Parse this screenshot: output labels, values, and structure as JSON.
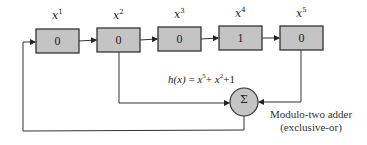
{
  "diagram": {
    "registers": [
      {
        "label_base": "x",
        "label_exp": "1",
        "value": "0"
      },
      {
        "label_base": "x",
        "label_exp": "2",
        "value": "0"
      },
      {
        "label_base": "x",
        "label_exp": "3",
        "value": "0"
      },
      {
        "label_base": "x",
        "label_exp": "4",
        "value": "1"
      },
      {
        "label_base": "x",
        "label_exp": "5",
        "value": "0"
      }
    ],
    "formula": {
      "lhs": "h(x)",
      "eq": " = ",
      "t1_base": "x",
      "t1_exp": "5",
      "plus1": "+ ",
      "t2_base": "x",
      "t2_exp": "2",
      "plus2": "+1"
    },
    "adder": {
      "symbol": "Σ",
      "caption_line1": "Modulo-two adder",
      "caption_line2": "(exclusive-or)"
    },
    "colors": {
      "box_fill": "#c4c4c4",
      "stroke": "#333333",
      "circle_fill": "#c4c4c4"
    }
  }
}
